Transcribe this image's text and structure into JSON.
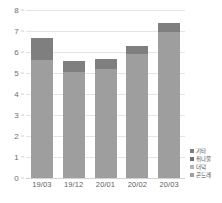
{
  "chart_data": {
    "type": "bar",
    "title": "",
    "subtitle": "",
    "xlabel": "",
    "ylabel": "",
    "stacked": true,
    "grid": true,
    "legend_position": "right-bottom",
    "categories": [
      "19/03",
      "19/12",
      "20/01",
      "20/02",
      "20/03"
    ],
    "ylim": [
      0,
      8
    ],
    "yticks": [
      "0",
      "1",
      "2",
      "3",
      "4",
      "5",
      "6",
      "7",
      "8"
    ],
    "ytick_values": [
      0,
      1,
      2,
      3,
      4,
      5,
      6,
      7,
      8
    ],
    "series": [
      {
        "name": "곤드레",
        "color": "#9e9e9e",
        "values": [
          5.6,
          5.05,
          5.2,
          5.9,
          6.95
        ]
      },
      {
        "name": "더덕",
        "color": "#b5b5b5",
        "values": [
          0,
          0,
          0,
          0,
          0
        ]
      },
      {
        "name": "취나물",
        "color": "#6f6f6f",
        "values": [
          0,
          0,
          0,
          0,
          0
        ]
      },
      {
        "name": "기타",
        "color": "#7f7f7f",
        "values": [
          1.05,
          0.5,
          0.48,
          0.38,
          0.43
        ]
      }
    ],
    "totals": [
      6.65,
      5.55,
      5.68,
      6.28,
      7.38
    ],
    "legend": [
      {
        "label": "기타",
        "color": "#7f7f7f"
      },
      {
        "label": "취나물",
        "color": "#6f6f6f"
      },
      {
        "label": "더덕",
        "color": "#b5b5b5"
      },
      {
        "label": "곤드레",
        "color": "#9e9e9e"
      }
    ],
    "colors": {
      "bar_base": "#9e9e9e",
      "bar_top": "#7f7f7f",
      "gridline": "#e4e4e4",
      "axis_text": "#6d6d6d",
      "background": "#ffffff"
    }
  }
}
